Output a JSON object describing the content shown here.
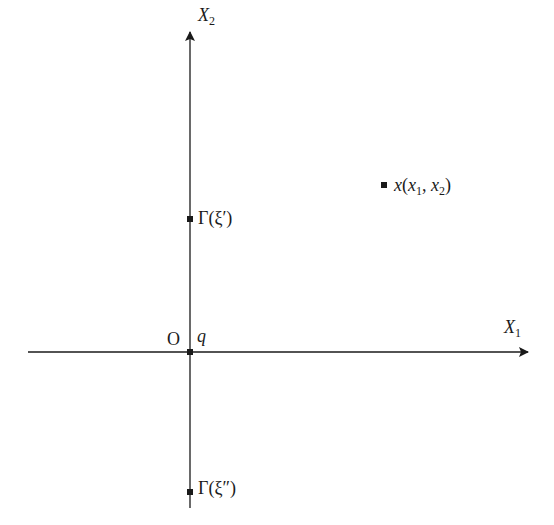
{
  "diagram": {
    "axes": {
      "x_axis_label": "X",
      "x_axis_sub": "1",
      "y_axis_label": "X",
      "y_axis_sub": "2",
      "origin_label": "O"
    },
    "points": {
      "q": {
        "label": "q"
      },
      "gamma_prime": {
        "label": "Γ(ξ′)"
      },
      "gamma_double_prime": {
        "label": "Γ(ξ″)"
      },
      "x_point": {
        "label_main": "x",
        "open": "(",
        "x1": "x",
        "x1_sub": "1",
        "comma": ", ",
        "x2": "x",
        "x2_sub": "2",
        "close": ")"
      }
    },
    "colors": {
      "stroke": "#1a1a1a",
      "background": "#ffffff"
    }
  }
}
